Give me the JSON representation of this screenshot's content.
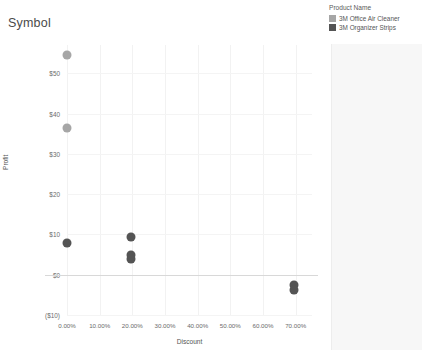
{
  "chart": {
    "title": "Symbol"
  },
  "legend": {
    "title": "Product Name",
    "items": [
      {
        "label": "3M Office Air Cleaner",
        "color": "#a6a6a6"
      },
      {
        "label": "3M Organizer Strips",
        "color": "#545454"
      }
    ]
  },
  "chart_data": {
    "type": "scatter",
    "title": "Symbol",
    "xlabel": "Discount",
    "ylabel": "Profit",
    "xlim": [
      0,
      0.75
    ],
    "ylim": [
      -10,
      57
    ],
    "grid": true,
    "legend_position": "right",
    "xticks": [
      "0.00%",
      "10.00%",
      "20.00%",
      "30.00%",
      "40.00%",
      "50.00%",
      "60.00%",
      "70.00%"
    ],
    "xtick_values": [
      0,
      0.1,
      0.2,
      0.3,
      0.4,
      0.5,
      0.6,
      0.7
    ],
    "yticks": [
      "$50",
      "$40",
      "$30",
      "$20",
      "$10",
      "$0",
      "($10)"
    ],
    "ytick_values": [
      50,
      40,
      30,
      20,
      10,
      0,
      -10
    ],
    "zero_reference_line": 0,
    "series": [
      {
        "name": "3M Office Air Cleaner",
        "color": "#a6a6a6",
        "points": [
          {
            "x": 0.0,
            "y": 54.5
          },
          {
            "x": 0.0,
            "y": 36.5
          }
        ]
      },
      {
        "name": "3M Organizer Strips",
        "color": "#545454",
        "points": [
          {
            "x": 0.0,
            "y": 7.9
          },
          {
            "x": 0.195,
            "y": 9.3
          },
          {
            "x": 0.195,
            "y": 5.0
          },
          {
            "x": 0.195,
            "y": 3.8
          },
          {
            "x": 0.695,
            "y": -2.6
          },
          {
            "x": 0.695,
            "y": -3.9
          }
        ]
      }
    ]
  }
}
